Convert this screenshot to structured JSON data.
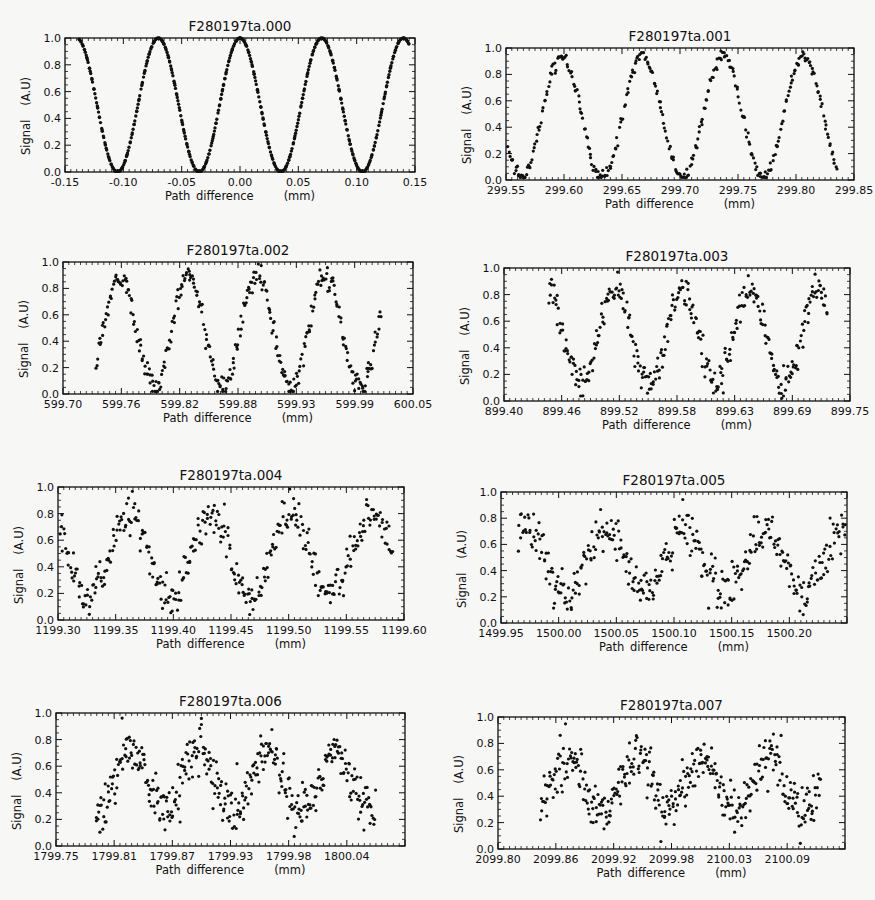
{
  "figure": {
    "panel_count": 8,
    "layout": "4 rows x 2 columns"
  },
  "chart_data": [
    {
      "id": "p0",
      "type": "scatter",
      "title": "F280197ta.000",
      "xlabel": "Path difference",
      "xunit": "(mm)",
      "ylabel": "Signal",
      "yunit": "(A.U)",
      "xlim": [
        -0.15,
        0.15
      ],
      "ylim": [
        0.0,
        1.0
      ],
      "xticks": [
        "-0.15",
        "-0.10",
        "-0.05",
        "0.00",
        "0.05",
        "0.10",
        "0.15"
      ],
      "yticks": [
        "0.0",
        "0.2",
        "0.4",
        "0.6",
        "0.8",
        "1.0"
      ],
      "frame": {
        "left": 65,
        "top": 38,
        "right": 415,
        "bottom": 172
      },
      "series": {
        "x_start": -0.138,
        "x_end": 0.145,
        "period": 0.07,
        "peak_x": 0.0,
        "y_min": 0.0,
        "y_max": 1.0,
        "noise": 0.004,
        "n_points": 520,
        "peak_values": [
          1.0,
          1.0,
          1.0,
          1.0,
          1.0
        ]
      }
    },
    {
      "id": "p1",
      "type": "scatter",
      "title": "F280197ta.001",
      "xlabel": "Path difference",
      "xunit": "(mm)",
      "ylabel": "Signal",
      "yunit": "(A.U)",
      "xlim": [
        299.55,
        299.85
      ],
      "ylim": [
        0.0,
        1.0
      ],
      "xticks": [
        "299.55",
        "299.60",
        "299.65",
        "299.70",
        "299.75",
        "299.80",
        "299.85"
      ],
      "yticks": [
        "0.0",
        "0.2",
        "0.4",
        "0.6",
        "0.8",
        "1.0"
      ],
      "frame": {
        "left": 506,
        "top": 48,
        "right": 854,
        "bottom": 180
      },
      "series": {
        "x_start": 299.552,
        "x_end": 299.835,
        "period": 0.0695,
        "peak_x": 299.598,
        "y_min": 0.02,
        "y_max": 0.94,
        "noise": 0.025,
        "n_points": 330,
        "peak_values": [
          0.95,
          0.96,
          0.96,
          0.92
        ]
      }
    },
    {
      "id": "p2",
      "type": "scatter",
      "title": "F280197ta.002",
      "xlabel": "Path difference",
      "xunit": "(mm)",
      "ylabel": "Signal",
      "yunit": "(A.U)",
      "xlim": [
        599.7,
        600.05
      ],
      "ylim": [
        0.0,
        1.0
      ],
      "xticks": [
        "599.70",
        "599.76",
        "599.82",
        "599.88",
        "599.93",
        "599.99",
        "600.05"
      ],
      "yticks": [
        "0.0",
        "0.2",
        "0.4",
        "0.6",
        "0.8",
        "1.0"
      ],
      "frame": {
        "left": 63,
        "top": 262,
        "right": 413,
        "bottom": 394
      },
      "series": {
        "x_start": 599.733,
        "x_end": 600.018,
        "period": 0.0685,
        "peak_x": 599.757,
        "y_min": 0.05,
        "y_max": 0.9,
        "noise": 0.045,
        "n_points": 330,
        "peak_values": [
          0.92,
          0.94,
          0.97,
          0.93
        ]
      }
    },
    {
      "id": "p3",
      "type": "scatter",
      "title": "F280197ta.003",
      "xlabel": "Path difference",
      "xunit": "(mm)",
      "ylabel": "Signal",
      "yunit": "(A.U)",
      "xlim": [
        899.4,
        899.75
      ],
      "ylim": [
        0.0,
        1.0
      ],
      "xticks": [
        "899.40",
        "899.46",
        "899.52",
        "899.58",
        "899.63",
        "899.69",
        "899.75"
      ],
      "yticks": [
        "0.0",
        "0.2",
        "0.4",
        "0.6",
        "0.8",
        "1.0"
      ],
      "frame": {
        "left": 504,
        "top": 268,
        "right": 850,
        "bottom": 401
      },
      "series": {
        "x_start": 899.445,
        "x_end": 899.727,
        "period": 0.0685,
        "peak_x": 899.512,
        "y_min": 0.12,
        "y_max": 0.84,
        "noise": 0.06,
        "n_points": 330,
        "peak_values": [
          0.92,
          0.93,
          0.95,
          0.88,
          0.88
        ]
      }
    },
    {
      "id": "p4",
      "type": "scatter",
      "title": "F280197ta.004",
      "xlabel": "Path difference",
      "xunit": "(mm)",
      "ylabel": "Signal",
      "yunit": "(A.U)",
      "xlim": [
        1199.3,
        1199.6
      ],
      "ylim": [
        0.0,
        1.0
      ],
      "xticks": [
        "1199.30",
        "1199.35",
        "1199.40",
        "1199.45",
        "1199.50",
        "1199.55",
        "1199.60"
      ],
      "yticks": [
        "0.0",
        "0.2",
        "0.4",
        "0.6",
        "0.8",
        "1.0"
      ],
      "frame": {
        "left": 58,
        "top": 487,
        "right": 404,
        "bottom": 620
      },
      "series": {
        "x_start": 1199.3,
        "x_end": 1199.59,
        "period": 0.07,
        "peak_x": 1199.362,
        "y_min": 0.18,
        "y_max": 0.8,
        "noise": 0.075,
        "n_points": 360,
        "peak_values": [
          0.95,
          0.9,
          0.9,
          0.9
        ]
      }
    },
    {
      "id": "p5",
      "type": "scatter",
      "title": "F280197ta.005",
      "xlabel": "Path difference",
      "xunit": "(mm)",
      "ylabel": "Signal",
      "yunit": "(A.U)",
      "xlim": [
        1499.95,
        1500.25
      ],
      "ylim": [
        0.0,
        1.0
      ],
      "xticks": [
        "1499.95",
        "1500.00",
        "1500.05",
        "1500.10",
        "1500.15",
        "1500.20",
        ""
      ],
      "yticks": [
        "0.0",
        "0.2",
        "0.4",
        "0.6",
        "0.8",
        "1.0"
      ],
      "frame": {
        "left": 501,
        "top": 492,
        "right": 847,
        "bottom": 623
      },
      "series": {
        "x_start": 1499.965,
        "x_end": 1500.25,
        "period": 0.069,
        "peak_x": 1499.972,
        "y_min": 0.24,
        "y_max": 0.72,
        "noise": 0.085,
        "n_points": 360,
        "peak_values": [
          0.88,
          0.8,
          0.91,
          0.88,
          0.82
        ]
      }
    },
    {
      "id": "p6",
      "type": "scatter",
      "title": "F280197ta.006",
      "xlabel": "Path difference",
      "xunit": "(mm)",
      "ylabel": "Signal",
      "yunit": "(A.U)",
      "xlim": [
        1799.75,
        1800.1
      ],
      "ylim": [
        0.0,
        1.0
      ],
      "xticks": [
        "1799.75",
        "1799.81",
        "1799.87",
        "1799.93",
        "1799.98",
        "1800.04",
        ""
      ],
      "yticks": [
        "0.0",
        "0.2",
        "0.4",
        "0.6",
        "0.8",
        "1.0"
      ],
      "frame": {
        "left": 56,
        "top": 713,
        "right": 405,
        "bottom": 846
      },
      "series": {
        "x_start": 1799.79,
        "x_end": 1800.07,
        "period": 0.068,
        "peak_x": 1799.826,
        "y_min": 0.25,
        "y_max": 0.72,
        "noise": 0.09,
        "n_points": 380,
        "peak_values": [
          0.97,
          0.91,
          0.91,
          0.82
        ]
      }
    },
    {
      "id": "p7",
      "type": "scatter",
      "title": "F280197ta.007",
      "xlabel": "Path difference",
      "xunit": "(mm)",
      "ylabel": "Signal",
      "yunit": "(A.U)",
      "xlim": [
        2099.8,
        2100.15
      ],
      "ylim": [
        0.0,
        1.0
      ],
      "xticks": [
        "2099.80",
        "2099.86",
        "2099.92",
        "2099.98",
        "2100.03",
        "2100.09",
        ""
      ],
      "yticks": [
        "0.0",
        "0.2",
        "0.4",
        "0.6",
        "0.8",
        "1.0"
      ],
      "frame": {
        "left": 498,
        "top": 717,
        "right": 845,
        "bottom": 849
      },
      "series": {
        "x_start": 2099.843,
        "x_end": 2100.125,
        "period": 0.068,
        "peak_x": 2099.87,
        "y_min": 0.28,
        "y_max": 0.7,
        "noise": 0.09,
        "n_points": 380,
        "peak_values": [
          0.94,
          0.89,
          0.88,
          0.8
        ]
      }
    }
  ]
}
